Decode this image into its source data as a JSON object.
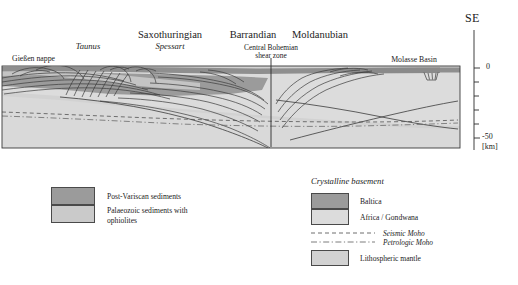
{
  "figure": {
    "type": "geological-cross-section",
    "orientation_label": "SE",
    "depth_axis": {
      "unit": "[km]",
      "ticks": [
        "0",
        "-50"
      ],
      "top_value": 0,
      "bottom_value": -50
    }
  },
  "section_labels": {
    "units": [
      {
        "text": "Saxothuringian",
        "x": 170,
        "y": 30
      },
      {
        "text": "Barrandian",
        "x": 253,
        "y": 30
      },
      {
        "text": "Moldanubian",
        "x": 320,
        "y": 30
      }
    ],
    "sub_units": [
      {
        "text": "Taunus",
        "x": 88,
        "y": 43
      },
      {
        "text": "Spessart",
        "x": 170,
        "y": 43
      }
    ],
    "features": [
      {
        "text": "Gießen nappe",
        "x": 10,
        "y": 56
      },
      {
        "text": "Molasse Basin",
        "x": 387,
        "y": 57
      }
    ],
    "shear_zone": {
      "line1": "Central Bohemian",
      "line2": "shear zone",
      "x": 280,
      "y": 44
    }
  },
  "legend_left": {
    "items": [
      {
        "label": "Post-Variscan sediments",
        "color": "#9b9b9b"
      },
      {
        "label_line1": "Palaeozoic sediments with",
        "label_line2": "ophiolites",
        "color": "#cacaca"
      }
    ]
  },
  "legend_right": {
    "title": "Crystalline  basement",
    "items": [
      {
        "label": "Baltica",
        "color": "#9b9b9b"
      },
      {
        "label": "Africa / Gondwana",
        "color": "#dcdcdc"
      }
    ],
    "lines": [
      {
        "label": "Seismic Moho",
        "style": "dashed"
      },
      {
        "label": "Petrologic Moho",
        "style": "dash-dot"
      }
    ],
    "mantle": {
      "label": "Lithospheric mantle",
      "color": "#d2d2d2"
    }
  },
  "colors": {
    "post_variscan": "#9b9b9b",
    "palaeozoic": "#cacaca",
    "baltica": "#9b9b9b",
    "africa_gondwana": "#dcdcdc",
    "lithospheric_mantle": "#d2d2d2",
    "structure_line": "#3b3b3b",
    "frame": "#3a3a3a"
  }
}
